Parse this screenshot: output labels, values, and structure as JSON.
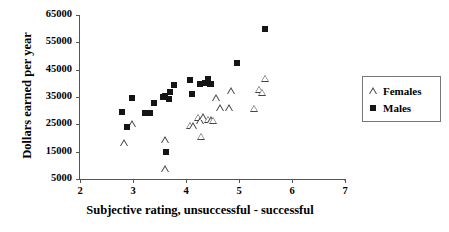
{
  "chart_data": {
    "type": "scatter",
    "title": "",
    "xlabel": "Subjective rating, unsuccessful - successful",
    "ylabel": "Dollars earned per year",
    "xlim": [
      2,
      7
    ],
    "ylim": [
      5000,
      65000
    ],
    "xticks": [
      2,
      3,
      4,
      5,
      6,
      7
    ],
    "xtick_labels": [
      "2",
      "3",
      "4",
      "5",
      "6",
      "7"
    ],
    "yticks": [
      5000,
      15000,
      25000,
      35000,
      45000,
      55000,
      65000
    ],
    "ytick_labels": [
      "5000",
      "15000",
      "25000",
      "35000",
      "45000",
      "55000",
      "65000"
    ],
    "grid": false,
    "legend_position": "right-outside",
    "series": [
      {
        "name": "Females",
        "marker": "open-triangle",
        "color": "#444444",
        "points": [
          [
            2.83,
            18200
          ],
          [
            2.99,
            25100
          ],
          [
            3.61,
            19200
          ],
          [
            3.61,
            8500
          ],
          [
            4.07,
            24500
          ],
          [
            4.13,
            24400
          ],
          [
            4.22,
            27500
          ],
          [
            4.26,
            26200
          ],
          [
            4.29,
            20500
          ],
          [
            4.33,
            27700
          ],
          [
            4.42,
            26700
          ],
          [
            4.47,
            26500
          ],
          [
            4.51,
            26300
          ],
          [
            4.57,
            34600
          ],
          [
            4.65,
            30800
          ],
          [
            4.82,
            30800
          ],
          [
            4.85,
            37200
          ],
          [
            5.28,
            30700
          ],
          [
            5.38,
            37700
          ],
          [
            5.43,
            36500
          ],
          [
            5.49,
            41700
          ]
        ]
      },
      {
        "name": "Males",
        "marker": "filled-square",
        "color": "#151515",
        "points": [
          [
            2.8,
            29600
          ],
          [
            2.89,
            24100
          ],
          [
            2.99,
            34800
          ],
          [
            3.22,
            29200
          ],
          [
            3.28,
            29100
          ],
          [
            3.33,
            29100
          ],
          [
            3.39,
            32800
          ],
          [
            3.57,
            34900
          ],
          [
            3.61,
            35400
          ],
          [
            3.63,
            14800
          ],
          [
            3.68,
            34200
          ],
          [
            3.7,
            36800
          ],
          [
            3.78,
            39300
          ],
          [
            4.07,
            41400
          ],
          [
            4.12,
            36200
          ],
          [
            4.26,
            39700
          ],
          [
            4.36,
            40300
          ],
          [
            4.42,
            41700
          ],
          [
            4.45,
            39900
          ],
          [
            4.48,
            39800
          ],
          [
            4.97,
            47300
          ],
          [
            5.49,
            59800
          ]
        ]
      }
    ]
  },
  "legend": {
    "items": [
      {
        "label": "Females",
        "marker": "open-triangle"
      },
      {
        "label": "Males",
        "marker": "filled-square"
      }
    ]
  }
}
